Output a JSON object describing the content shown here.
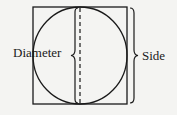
{
  "diagram": {
    "labels": {
      "diameter": "Diameter",
      "side": "Side"
    },
    "shapes": {
      "square": {
        "x": 33,
        "y": 7,
        "size": 95
      },
      "circle": {
        "cx": 80.5,
        "cy": 54.5,
        "r": 47.5
      },
      "dashed_diameter_x": 80
    },
    "colors": {
      "stroke": "#1a1a1a",
      "background": "#f4f4f2"
    }
  }
}
